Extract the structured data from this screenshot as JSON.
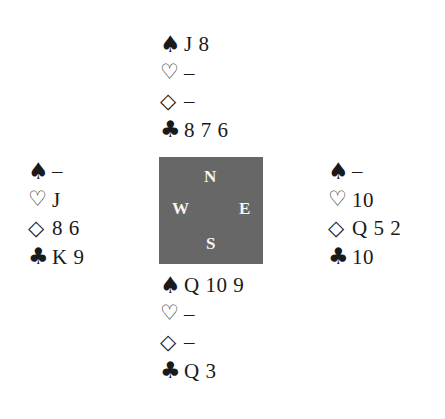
{
  "diagram": {
    "type": "bridge-deal",
    "suit_symbols": {
      "spades": "♠",
      "hearts": "♡",
      "diamonds": "◇",
      "clubs": "♣"
    },
    "compass": {
      "north": "N",
      "west": "W",
      "east": "E",
      "south": "S",
      "box_color": "#676767"
    },
    "hands": {
      "north": {
        "spades": "J 8",
        "hearts": "–",
        "diamonds": "–",
        "clubs": "8 7 6"
      },
      "west": {
        "spades": "–",
        "hearts": "J",
        "diamonds": "8 6",
        "clubs": "K 9"
      },
      "east": {
        "spades": "–",
        "hearts": "10",
        "diamonds": "Q 5 2",
        "clubs": "10"
      },
      "south": {
        "spades": "Q 10 9",
        "hearts": "–",
        "diamonds": "–",
        "clubs": "Q 3"
      }
    }
  }
}
